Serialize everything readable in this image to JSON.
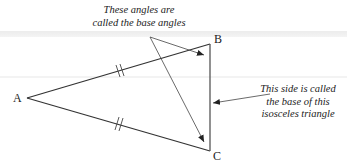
{
  "diagram": {
    "title": "Isosceles triangle",
    "vertices": [
      {
        "id": "A",
        "label": "A"
      },
      {
        "id": "B",
        "label": "B"
      },
      {
        "id": "C",
        "label": "C"
      }
    ],
    "annotations": {
      "base_angles": {
        "line1": "These angles are",
        "line2": "called the base angles"
      },
      "base": {
        "line1": "This side is called",
        "line2": "the base of this",
        "line3": "isosceles triangle"
      }
    },
    "equal_sides": [
      "AB",
      "AC"
    ],
    "base_side": "BC",
    "colors": {
      "stroke": "#333333",
      "text": "#222222",
      "background": "#ffffff"
    }
  }
}
